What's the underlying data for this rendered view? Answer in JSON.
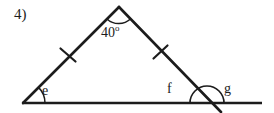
{
  "figure": {
    "problem_number": "4)",
    "background_color": "#ffffff",
    "stroke_color": "#1c1c1c",
    "labels": {
      "apex_angle_value": "40",
      "apex_angle_degree_symbol": "o",
      "angle_e": "e",
      "angle_f": "f",
      "angle_g": "g"
    },
    "geometry": {
      "description": "Isosceles triangle on a horizontal base line; the right side is extended beyond the base to form an exterior angle.",
      "base_line": {
        "x1": 22,
        "y1": 103,
        "x2": 262,
        "y2": 103
      },
      "apex": {
        "x": 119,
        "y": 7
      },
      "left_vertex": {
        "x": 23,
        "y": 103
      },
      "right_vertex": {
        "x": 207,
        "y": 103
      },
      "extension_end": {
        "x": 222,
        "y": 113
      },
      "congruent_tick_marks": [
        {
          "side": "left",
          "x": 68,
          "y": 55
        },
        {
          "side": "right",
          "x": 160,
          "y": 52
        }
      ],
      "angle_arcs": [
        {
          "name": "apex-arc",
          "center_x": 119,
          "center_y": 7,
          "radius": 17
        },
        {
          "name": "angle-e-arc",
          "center_x": 23,
          "center_y": 103,
          "radius": 22
        },
        {
          "name": "angle-g-arc",
          "center_x": 207,
          "center_y": 103,
          "radius": 17
        }
      ]
    }
  }
}
